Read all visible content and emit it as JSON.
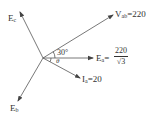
{
  "diagram": {
    "type": "phasor-diagram",
    "origin": {
      "x": 43,
      "y": 58
    },
    "phasors": [
      {
        "id": "Ec",
        "label_main": "E",
        "label_sub": "c",
        "tip": {
          "x": 20,
          "y": 12
        }
      },
      {
        "id": "Eb",
        "label_main": "E",
        "label_sub": "b",
        "tip": {
          "x": 18,
          "y": 101
        }
      },
      {
        "id": "Vab",
        "label_main": "V",
        "label_sub": "ab",
        "value_text": "=220",
        "tip": {
          "x": 113,
          "y": 15
        }
      },
      {
        "id": "Ea",
        "label_main": "E",
        "label_sub": "a",
        "value_text": "=",
        "fraction_num": "220",
        "fraction_den": "√3",
        "tip": {
          "x": 93,
          "y": 58
        }
      },
      {
        "id": "Ia",
        "label_main": "I",
        "label_sub": "a",
        "value_text": "=20",
        "tip": {
          "x": 80,
          "y": 78
        }
      }
    ],
    "angles": [
      {
        "label": "30°",
        "between": [
          "Ea",
          "Vab"
        ]
      },
      {
        "label": "θ",
        "between": [
          "Ea",
          "Ia"
        ]
      }
    ],
    "line_color": "#555555",
    "text_color": "#333333"
  }
}
